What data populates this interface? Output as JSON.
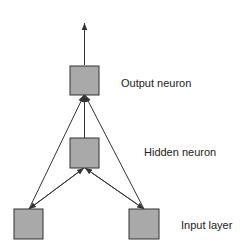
{
  "diagram": {
    "type": "neural-network",
    "labels": {
      "output": "Output neuron",
      "hidden": "Hidden neuron",
      "input": "Input layer"
    },
    "nodes": [
      {
        "id": "output",
        "role": "output neuron"
      },
      {
        "id": "hidden",
        "role": "hidden neuron"
      },
      {
        "id": "input-left",
        "role": "input"
      },
      {
        "id": "input-right",
        "role": "input"
      }
    ],
    "edges": [
      {
        "from": "input-left",
        "to": "hidden"
      },
      {
        "from": "input-right",
        "to": "hidden"
      },
      {
        "from": "input-left",
        "to": "output"
      },
      {
        "from": "input-right",
        "to": "output"
      },
      {
        "from": "hidden",
        "to": "output"
      },
      {
        "from": "output",
        "to": "out"
      }
    ],
    "colors": {
      "node_fill": "#a9a9a9",
      "stroke": "#333333"
    }
  }
}
